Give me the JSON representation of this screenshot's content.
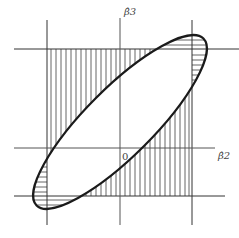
{
  "diagram": {
    "type": "confidence-region-ellipse-vs-rectangle",
    "axes": {
      "x_label": "β̂2",
      "y_label": "β̂3",
      "origin_label": "0"
    },
    "elements": {
      "ellipse": "joint confidence ellipse (tilted, positive correlation)",
      "rectangle": "individual confidence intervals box",
      "vertical_hatching": "region inside rectangle but outside ellipse",
      "horizontal_hatching": "region inside ellipse but outside rectangle"
    },
    "colors": {
      "line": "#222222",
      "hatch": "#555555",
      "axis": "#555555"
    }
  }
}
